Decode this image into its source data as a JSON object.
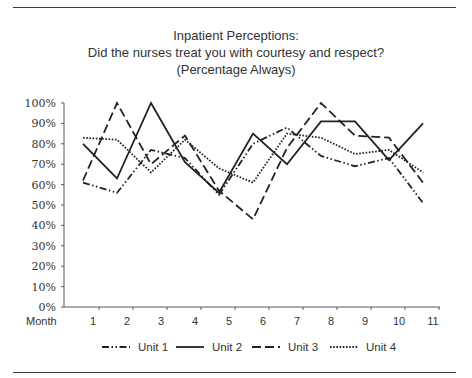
{
  "chart_data": {
    "type": "line",
    "title": "Inpatient Perceptions:",
    "subtitle": "Did the nurses treat you with courtesy and respect?",
    "subtitle2": "(Percentage Always)",
    "xlabel": "Month",
    "ylabel": "",
    "categories": [
      "1",
      "2",
      "3",
      "4",
      "5",
      "6",
      "7",
      "8",
      "9",
      "10",
      "11"
    ],
    "yticks": [
      "0%",
      "10%",
      "20%",
      "30%",
      "40%",
      "50%",
      "60%",
      "70%",
      "80%",
      "90%",
      "100%"
    ],
    "ylim": [
      0,
      100
    ],
    "grid": false,
    "legend_position": "bottom",
    "series": [
      {
        "name": "Unit 1",
        "style": "dash-dot-dot",
        "values": [
          61,
          56,
          77,
          73,
          55,
          80,
          88,
          74,
          69,
          73,
          51
        ]
      },
      {
        "name": "Unit 2",
        "style": "solid",
        "values": [
          80,
          63,
          100,
          71,
          56,
          85,
          70,
          91,
          91,
          72,
          90
        ]
      },
      {
        "name": "Unit 3",
        "style": "dashed",
        "values": [
          62,
          100,
          70,
          84,
          57,
          43,
          78,
          100,
          84,
          83,
          61
        ]
      },
      {
        "name": "Unit 4",
        "style": "dotted",
        "values": [
          83,
          82,
          66,
          82,
          68,
          61,
          85,
          83,
          75,
          77,
          66
        ]
      }
    ]
  },
  "colors": {
    "line": "#222222",
    "axis": "#555555",
    "text": "#333333"
  }
}
